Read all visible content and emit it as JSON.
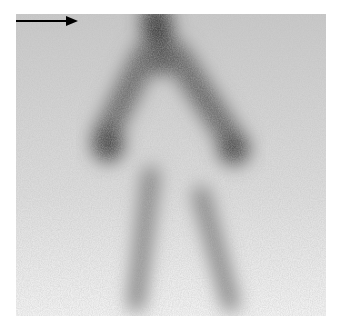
{
  "image": {
    "type": "scintigraphy",
    "description": "Grayscale nuclear medicine scan with diffuse uptake and an annotation arrow pointing to a focal area of uptake near top center",
    "annotations": [
      {
        "kind": "arrow",
        "direction": "right",
        "x1": 73,
        "y1": 47,
        "x2": 135,
        "y2": 47,
        "color": "#000000"
      }
    ],
    "colors": {
      "background": "#ffffff",
      "uptake_dark": "#3a3a3a",
      "noise_light": "#e4e4e4"
    }
  }
}
